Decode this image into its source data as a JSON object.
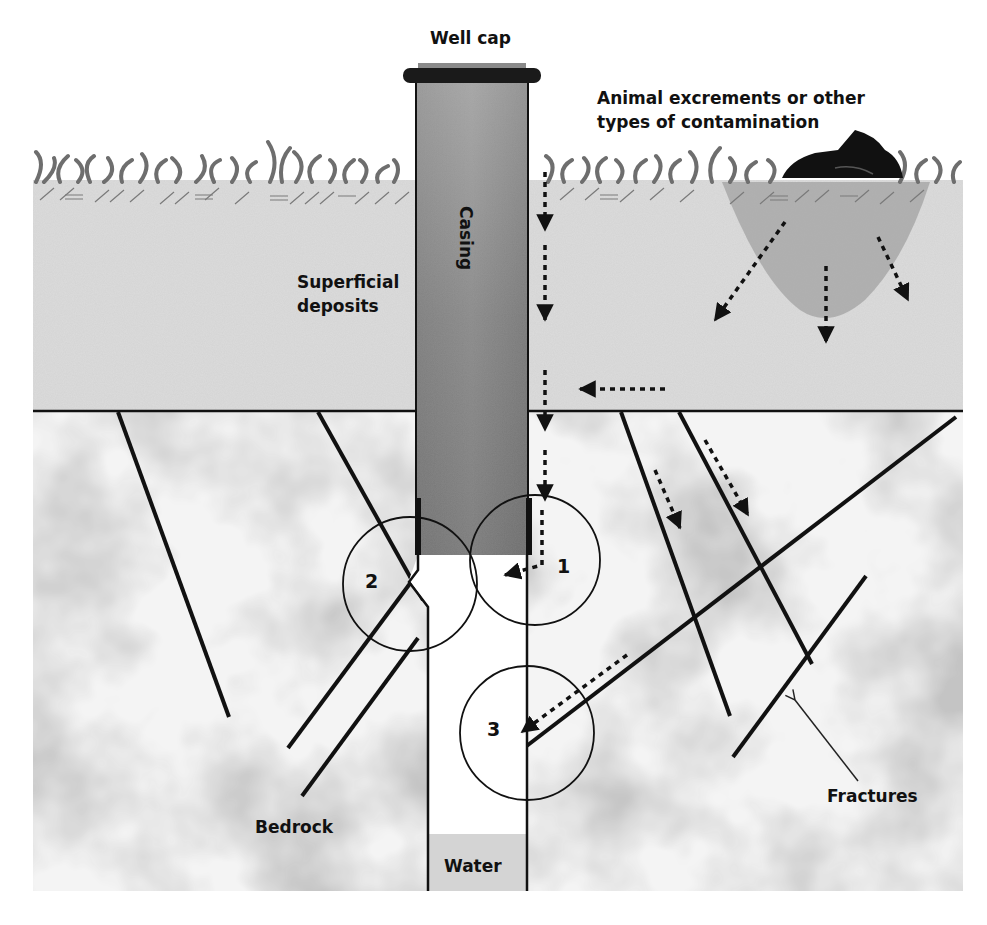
{
  "diagram": {
    "labels": {
      "well_cap": "Well cap",
      "casing": "Casing",
      "contamination": [
        "Animal excrements or other",
        "types of contamination"
      ],
      "superficial_deposits": [
        "Superficial",
        "deposits"
      ],
      "bedrock": "Bedrock",
      "fractures": "Fractures",
      "water": "Water"
    },
    "pathway_markers": [
      {
        "id": "1",
        "label": "1",
        "description": "Leak along outside of casing into well at casing base"
      },
      {
        "id": "2",
        "label": "2",
        "description": "Fracture intersecting open borehole below casing"
      },
      {
        "id": "3",
        "label": "3",
        "description": "Fracture carrying contaminated water into borehole"
      }
    ],
    "colors": {
      "superficial": "#d9d9d9",
      "bedrock_light": "#f2f2f2",
      "bedrock_dark": "#a8a8a8",
      "casing": "#8c8c8c",
      "cap": "#1a1a1a",
      "grass": "#6e6e6e",
      "plume": "#a9a9a9",
      "water": "#d4d4d4",
      "lines": "#111111"
    }
  }
}
